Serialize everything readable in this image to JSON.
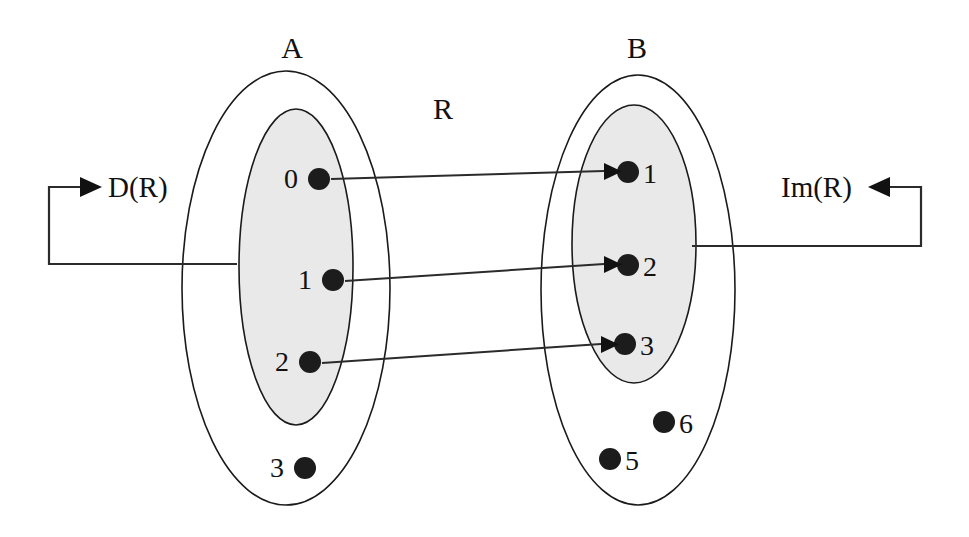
{
  "diagram": {
    "title_labels": {
      "set_a": "A",
      "set_b": "B",
      "relation": "R"
    },
    "annotations": {
      "domain": "D(R)",
      "image": "Im(R)"
    },
    "colors": {
      "shaded_region": "#e9e9e9",
      "outline": "#1a1a1a",
      "dot": "#1c1c1c",
      "arrow": "#2b2b2b",
      "background": "#ffffff"
    },
    "set_a": {
      "name": "A",
      "outer_ellipse": {
        "cx": 286,
        "cy": 288,
        "rx": 104,
        "ry": 217
      },
      "inner_ellipse": {
        "cx": 296,
        "cy": 267,
        "rx": 57,
        "ry": 158
      },
      "elements": [
        {
          "label": "0",
          "cx": 319,
          "cy": 179,
          "r": 11,
          "label_x": 291,
          "label_y": 188,
          "in_domain": true
        },
        {
          "label": "1",
          "cx": 333,
          "cy": 280,
          "r": 11,
          "label_x": 305,
          "label_y": 289,
          "in_domain": true
        },
        {
          "label": "2",
          "cx": 310,
          "cy": 362,
          "r": 11,
          "label_x": 282,
          "label_y": 371,
          "in_domain": true
        },
        {
          "label": "3",
          "cx": 305,
          "cy": 468,
          "r": 11,
          "label_x": 277,
          "label_y": 477,
          "in_domain": false
        }
      ]
    },
    "set_b": {
      "name": "B",
      "outer_ellipse": {
        "cx": 638,
        "cy": 290,
        "rx": 97,
        "ry": 215
      },
      "inner_ellipse": {
        "cx": 634,
        "cy": 244,
        "rx": 62,
        "ry": 139
      },
      "elements": [
        {
          "label": "1",
          "cx": 628,
          "cy": 172,
          "r": 11,
          "label_x": 643,
          "label_y": 182,
          "in_image": true
        },
        {
          "label": "2",
          "cx": 628,
          "cy": 265,
          "r": 11,
          "label_x": 643,
          "label_y": 275,
          "in_image": true
        },
        {
          "label": "3",
          "cx": 625,
          "cy": 344,
          "r": 11,
          "label_x": 640,
          "label_y": 354,
          "in_image": true
        },
        {
          "label": "6",
          "cx": 664,
          "cy": 422,
          "r": 11,
          "label_x": 679,
          "label_y": 432,
          "in_image": false
        },
        {
          "label": "5",
          "cx": 610,
          "cy": 459,
          "r": 11,
          "label_x": 625,
          "label_y": 469,
          "in_image": false
        }
      ]
    },
    "relation_name": "R",
    "relation_label_pos": {
      "x": 443,
      "y": 119
    },
    "mappings": [
      {
        "from": "0",
        "to": "1",
        "x1": 331,
        "y1": 179,
        "x2": 609,
        "y2": 171
      },
      {
        "from": "1",
        "to": "2",
        "x1": 345,
        "y1": 281,
        "x2": 609,
        "y2": 264
      },
      {
        "from": "2",
        "to": "3",
        "x1": 322,
        "y1": 363,
        "x2": 606,
        "y2": 344
      }
    ],
    "domain_leader": {
      "label": "D(R)",
      "label_x": 103,
      "label_y": 195,
      "arrow_tip_x": 96,
      "arrow_y": 187,
      "corner_x": 49,
      "bottom_y": 264,
      "end_x": 237
    },
    "image_leader": {
      "label": "Im(R)",
      "label_x": 789,
      "label_y": 196,
      "arrow_tip_x": 874,
      "arrow_y": 187,
      "corner_x": 921,
      "bottom_y": 246,
      "end_x": 692
    }
  }
}
